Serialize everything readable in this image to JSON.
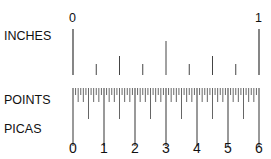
{
  "labels": {
    "inches": "INCHES",
    "points": "POINTS",
    "picas": "PICAS"
  },
  "inch_ticks": {
    "start": "0",
    "end": "1",
    "subdivisions": 8
  },
  "pica_numbers": [
    "0",
    "1",
    "2",
    "3",
    "4",
    "5",
    "6"
  ],
  "points_per_inch": 72,
  "colors": {
    "ink": "#222222",
    "tick": "#555555"
  }
}
